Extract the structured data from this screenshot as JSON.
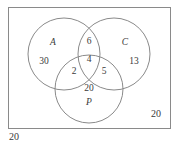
{
  "diagram": {
    "type": "venn",
    "stroke_color": "#8a8a8a",
    "text_color": "#3a3a3a",
    "background_color": "#ffffff",
    "universe_rect": {
      "label": "20",
      "x": 8,
      "y": 7,
      "width": 162,
      "height": 121
    },
    "sets": [
      {
        "id": "A",
        "label": "A",
        "cx": 64,
        "cy": 54,
        "r": 36
      },
      {
        "id": "C",
        "label": "C",
        "cx": 114,
        "cy": 54,
        "r": 36
      },
      {
        "id": "P",
        "label": "P",
        "cx": 89,
        "cy": 89,
        "r": 34
      }
    ],
    "set_labels": [
      {
        "text": "A",
        "x": 53,
        "y": 43
      },
      {
        "text": "C",
        "x": 125,
        "y": 43
      },
      {
        "text": "P",
        "x": 89,
        "y": 103
      }
    ],
    "regions": [
      {
        "name": "A-only",
        "value": "30",
        "x": 44,
        "y": 62
      },
      {
        "name": "C-only",
        "value": "13",
        "x": 134,
        "y": 62
      },
      {
        "name": "A-and-C-only",
        "value": "6",
        "x": 89,
        "y": 42
      },
      {
        "name": "A-and-C-and-P",
        "value": "4",
        "x": 89,
        "y": 60
      },
      {
        "name": "A-and-P-only",
        "value": "2",
        "x": 74,
        "y": 72
      },
      {
        "name": "C-and-P-only",
        "value": "5",
        "x": 104,
        "y": 72
      },
      {
        "name": "P-only",
        "value": "20",
        "x": 89,
        "y": 89
      }
    ],
    "annotations": [
      {
        "name": "universe-count",
        "value": "20",
        "x": 156,
        "y": 114,
        "position": "inside-rect-bottom-right"
      },
      {
        "name": "outside-count",
        "value": "20",
        "x": 14,
        "y": 137,
        "position": "below-rect-bottom-left"
      }
    ]
  }
}
